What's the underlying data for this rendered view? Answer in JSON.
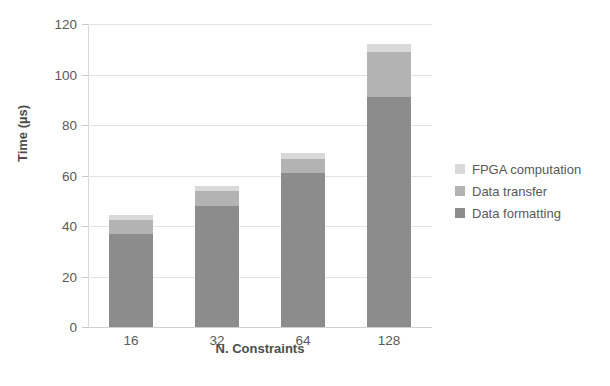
{
  "chart_data": {
    "type": "bar",
    "title": "",
    "subtitle": "",
    "stacked": true,
    "xlabel": "N. Constraints",
    "ylabel": "Time (µs)",
    "categories": [
      "16",
      "32",
      "64",
      "128"
    ],
    "ylim": [
      0,
      120
    ],
    "yticks": [
      0,
      20,
      40,
      60,
      80,
      100,
      120
    ],
    "ytick_labels": [
      "0",
      "20",
      "40",
      "60",
      "80",
      "100",
      "120"
    ],
    "grid": "horizontal",
    "legend_position": "right",
    "series": [
      {
        "name": "Data formatting",
        "color": "#8c8c8c",
        "values": [
          37,
          48,
          61,
          91
        ]
      },
      {
        "name": "Data transfer",
        "color": "#b3b3b3",
        "values": [
          5.5,
          6,
          5.5,
          18
        ]
      },
      {
        "name": "FPGA computation",
        "color": "#d9d9d9",
        "values": [
          2,
          2,
          2.5,
          3
        ]
      }
    ],
    "totals": [
      44.5,
      56,
      69,
      112
    ],
    "legend_order": [
      "FPGA computation",
      "Data transfer",
      "Data formatting"
    ]
  },
  "axis": {
    "y_title": "Time (µs)",
    "x_title": "N. Constraints"
  },
  "legend": {
    "items": [
      {
        "label": "FPGA computation",
        "color": "#d9d9d9"
      },
      {
        "label": "Data transfer",
        "color": "#b3b3b3"
      },
      {
        "label": "Data formatting",
        "color": "#8c8c8c"
      }
    ]
  }
}
